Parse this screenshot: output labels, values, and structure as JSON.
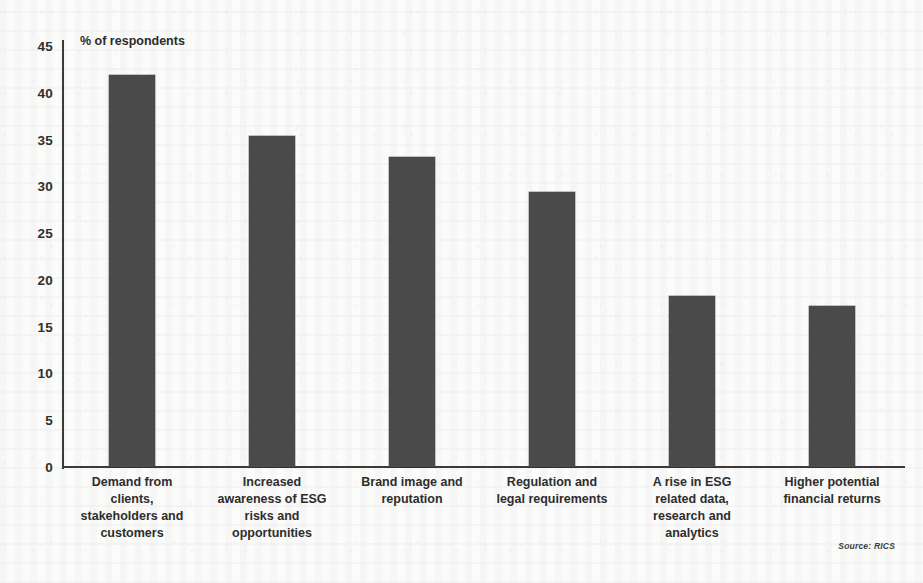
{
  "chart_data": {
    "type": "bar",
    "title": "",
    "subtitle": "",
    "xlabel": "",
    "ylabel": "% of respondents",
    "ylim": [
      0,
      45
    ],
    "yticks": [
      45,
      40,
      35,
      30,
      25,
      20,
      15,
      10,
      5,
      0
    ],
    "grid": false,
    "legend": null,
    "bar_color": "#4a4a4a",
    "categories": [
      "Demand from clients, stakeholders and customers",
      "Increased awareness of ESG risks and opportunities",
      "Brand image and reputation",
      "Regulation and legal requirements",
      "A rise in ESG related data, research and analytics",
      "Higher potential financial returns"
    ],
    "category_lines": [
      [
        "Demand from",
        "clients,",
        "stakeholders and",
        "customers"
      ],
      [
        "Increased",
        "awareness of ESG",
        "risks and",
        "opportunities"
      ],
      [
        "Brand image and",
        "reputation"
      ],
      [
        "Regulation and",
        "legal requirements"
      ],
      [
        "A rise in ESG",
        "related data,",
        "research and",
        "analytics"
      ],
      [
        "Higher potential",
        "financial returns"
      ]
    ],
    "values": [
      41.9,
      35.4,
      33.1,
      29.4,
      18.3,
      17.2
    ]
  },
  "annotations": {
    "source": "Source: RICS"
  }
}
